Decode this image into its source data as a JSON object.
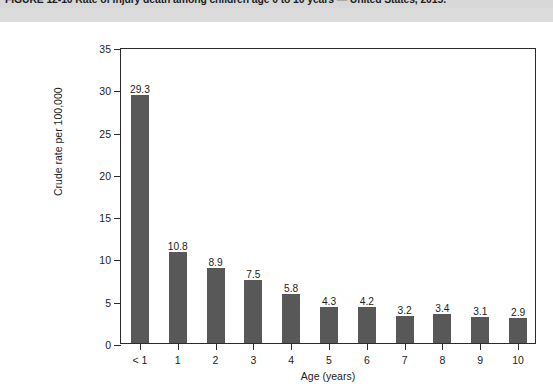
{
  "figure": {
    "title": "FIGURE 12-10 Rate of injury death among children age 0 to 10 years — United States, 2015."
  },
  "chart_data": {
    "type": "bar",
    "title": "FIGURE 12-10 Rate of injury death among children age 0 to 10 years — United States, 2015.",
    "categories": [
      "< 1",
      "1",
      "2",
      "3",
      "4",
      "5",
      "6",
      "7",
      "8",
      "9",
      "10"
    ],
    "values": [
      29.3,
      10.8,
      8.9,
      7.5,
      5.8,
      4.3,
      4.2,
      3.2,
      3.4,
      3.1,
      2.9
    ],
    "value_labels": [
      "29.3",
      "10.8",
      "8.9",
      "7.5",
      "5.8",
      "4.3",
      "4.2",
      "3.2",
      "3.4",
      "3.1",
      "2.9"
    ],
    "xlabel": "Age (years)",
    "ylabel": "Crude rate per 100,000",
    "ylim": [
      0,
      35
    ],
    "yticks": [
      0,
      5,
      10,
      15,
      20,
      25,
      30,
      35
    ],
    "ytick_labels": [
      "0",
      "5",
      "10",
      "15",
      "20",
      "25",
      "30",
      "35"
    ],
    "grid": false,
    "legend": null,
    "bar_color": "#585858",
    "axis_color": "#2b2b2b"
  }
}
